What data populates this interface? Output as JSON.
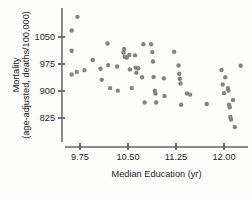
{
  "chart_data": {
    "type": "scatter",
    "title": "",
    "xlabel": "Median Education (yr)",
    "ylabel_line1": "Mortality",
    "ylabel_line2": "(age-adjusted, deaths/100,000)",
    "xticks": [
      "9.75",
      "10.50",
      "11.25",
      "12.00"
    ],
    "xtick_values": [
      9.75,
      10.5,
      11.25,
      12.0
    ],
    "yticks": [
      "1050",
      "975",
      "900",
      "825"
    ],
    "ytick_values": [
      1050,
      975,
      900,
      825
    ],
    "xlim": [
      9.45,
      12.35
    ],
    "ylim": [
      790,
      1125
    ],
    "grid": false,
    "legend": "none",
    "marker": "filled-circle",
    "marker_color": "#838383",
    "axis_color": "#8a8a8a",
    "points": [
      {
        "x": 9.62,
        "y": 1068
      },
      {
        "x": 9.62,
        "y": 1012
      },
      {
        "x": 9.62,
        "y": 946
      },
      {
        "x": 9.71,
        "y": 1106
      },
      {
        "x": 9.7,
        "y": 953
      },
      {
        "x": 9.82,
        "y": 958
      },
      {
        "x": 9.95,
        "y": 986
      },
      {
        "x": 10.07,
        "y": 962
      },
      {
        "x": 10.09,
        "y": 931
      },
      {
        "x": 10.18,
        "y": 1032
      },
      {
        "x": 10.19,
        "y": 972
      },
      {
        "x": 10.22,
        "y": 908
      },
      {
        "x": 10.33,
        "y": 968
      },
      {
        "x": 10.34,
        "y": 901
      },
      {
        "x": 10.43,
        "y": 1007
      },
      {
        "x": 10.44,
        "y": 1017
      },
      {
        "x": 10.45,
        "y": 995
      },
      {
        "x": 10.48,
        "y": 993
      },
      {
        "x": 10.52,
        "y": 1000
      },
      {
        "x": 10.53,
        "y": 960
      },
      {
        "x": 10.56,
        "y": 908
      },
      {
        "x": 10.61,
        "y": 999
      },
      {
        "x": 10.62,
        "y": 965
      },
      {
        "x": 10.63,
        "y": 951
      },
      {
        "x": 10.66,
        "y": 963
      },
      {
        "x": 10.72,
        "y": 938
      },
      {
        "x": 10.74,
        "y": 1030
      },
      {
        "x": 10.76,
        "y": 868
      },
      {
        "x": 10.86,
        "y": 1030
      },
      {
        "x": 10.88,
        "y": 1008
      },
      {
        "x": 10.89,
        "y": 982
      },
      {
        "x": 10.9,
        "y": 939
      },
      {
        "x": 10.92,
        "y": 901
      },
      {
        "x": 10.93,
        "y": 893
      },
      {
        "x": 10.94,
        "y": 868
      },
      {
        "x": 11.06,
        "y": 935
      },
      {
        "x": 11.07,
        "y": 886
      },
      {
        "x": 11.22,
        "y": 1009
      },
      {
        "x": 11.29,
        "y": 971
      },
      {
        "x": 11.3,
        "y": 948
      },
      {
        "x": 11.31,
        "y": 934
      },
      {
        "x": 11.32,
        "y": 921
      },
      {
        "x": 11.33,
        "y": 862
      },
      {
        "x": 11.42,
        "y": 893
      },
      {
        "x": 11.47,
        "y": 890
      },
      {
        "x": 11.73,
        "y": 864
      },
      {
        "x": 11.96,
        "y": 958
      },
      {
        "x": 11.98,
        "y": 918
      },
      {
        "x": 12.0,
        "y": 894
      },
      {
        "x": 12.02,
        "y": 938
      },
      {
        "x": 12.06,
        "y": 908
      },
      {
        "x": 12.07,
        "y": 901
      },
      {
        "x": 12.08,
        "y": 862
      },
      {
        "x": 12.09,
        "y": 855
      },
      {
        "x": 12.1,
        "y": 828
      },
      {
        "x": 12.11,
        "y": 821
      },
      {
        "x": 12.14,
        "y": 875
      },
      {
        "x": 12.17,
        "y": 800
      },
      {
        "x": 12.26,
        "y": 970
      }
    ]
  }
}
